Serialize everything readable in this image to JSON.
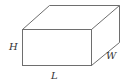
{
  "figure": {
    "type": "rectangular-box",
    "labels": {
      "height": "H",
      "length": "L",
      "width": "W"
    },
    "colors": {
      "edge": "#6e6e6e",
      "label": "#333333",
      "background": "#ffffff"
    },
    "vertices": {
      "front_top_left": [
        22,
        29
      ],
      "front_top_right": [
        91,
        29
      ],
      "front_bottom_left": [
        22,
        65
      ],
      "front_bottom_right": [
        91,
        65
      ],
      "back_top_left": [
        49,
        5
      ],
      "back_top_right": [
        119,
        5
      ],
      "back_bottom_right": [
        119,
        42
      ]
    }
  }
}
